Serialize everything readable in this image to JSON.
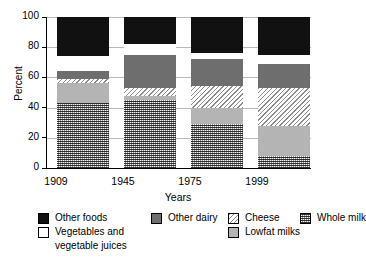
{
  "chart_data": {
    "type": "bar",
    "subtype": "stacked-bar-100",
    "title": "",
    "xlabel": "Years",
    "ylabel": "Percent",
    "ylim": [
      0,
      100
    ],
    "yticks": [
      0,
      20,
      40,
      60,
      80,
      100
    ],
    "ytick_labels": [
      "0",
      "20",
      "40",
      "60",
      "80",
      "100"
    ],
    "grid": true,
    "legend_position": "below",
    "categories": [
      "1909",
      "1945",
      "1975",
      "1999"
    ],
    "series": [
      {
        "name": "Whole milk",
        "key": "whole",
        "fill": "checkered-dark-gray",
        "values": [
          43,
          45,
          29,
          8
        ]
      },
      {
        "name": "Lowfat milks",
        "key": "lowfat",
        "fill": "light-gray-solid",
        "values": [
          13,
          3,
          11,
          20
        ]
      },
      {
        "name": "Cheese",
        "key": "cheese",
        "fill": "diagonal-hatch",
        "values": [
          3,
          5,
          14,
          25
        ]
      },
      {
        "name": "Other dairy",
        "key": "other-dairy",
        "fill": "medium-gray-solid",
        "values": [
          5,
          22,
          18,
          16
        ]
      },
      {
        "name": "Vegetables and vegetable juices",
        "key": "vegetables",
        "fill": "white",
        "values": [
          10,
          7,
          4,
          6
        ]
      },
      {
        "name": "Other foods",
        "key": "other-foods",
        "fill": "black",
        "values": [
          26,
          18,
          24,
          25
        ]
      }
    ],
    "stack_order_bottom_to_top": [
      "whole",
      "lowfat",
      "cheese",
      "other-dairy",
      "vegetables",
      "other-foods"
    ],
    "colors": {
      "other-foods": "#111111",
      "vegetables": "#ffffff",
      "other-dairy": "#6e6e6e",
      "cheese": "#d8d8d8",
      "lowfat": "#b4b4b4",
      "whole": "#8f8f8f",
      "axis": "#000000",
      "grid": "#b9b9b9"
    }
  },
  "legend": {
    "entries": [
      {
        "label": "Other foods",
        "key": "other-foods"
      },
      {
        "label": "Other dairy",
        "key": "other-dairy"
      },
      {
        "label": "Cheese",
        "key": "cheese"
      },
      {
        "label": "Whole milk",
        "key": "whole"
      },
      {
        "label": "Vegetables and",
        "key": "vegetables"
      },
      {
        "label": "vegetable juices",
        "key": "vegetables-line2"
      },
      {
        "label": "Lowfat milks",
        "key": "lowfat"
      }
    ]
  }
}
